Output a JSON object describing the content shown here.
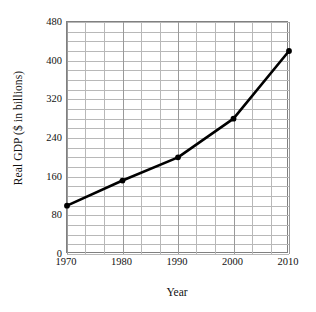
{
  "chart_data": {
    "type": "line",
    "title": "",
    "xlabel": "Year",
    "ylabel": "Real GDP ($ in billions)",
    "x": [
      1970,
      1980,
      1990,
      2000,
      2010
    ],
    "values": [
      100,
      152,
      200,
      280,
      420
    ],
    "series": [
      {
        "name": "Real GDP",
        "values": [
          100,
          152,
          200,
          280,
          420
        ]
      }
    ],
    "xlim": [
      1970,
      2010
    ],
    "ylim": [
      0,
      480
    ],
    "ytick_labels": [
      "0",
      "80",
      "160",
      "240",
      "320",
      "400",
      "480"
    ],
    "ytick_values": [
      0,
      80,
      160,
      240,
      320,
      400,
      480
    ],
    "xtick_labels": [
      "1970",
      "1980",
      "1990",
      "2000",
      "2010"
    ],
    "xtick_values": [
      1970,
      1980,
      1990,
      2000,
      2010
    ],
    "y_minor_step": 20,
    "x_minor_divisions": 3,
    "grid": true,
    "legend": "none",
    "line_color": "#000000",
    "grid_color": "#b8b8b8",
    "axis_color": "#808080",
    "marker": "circle",
    "marker_color": "#000000"
  }
}
